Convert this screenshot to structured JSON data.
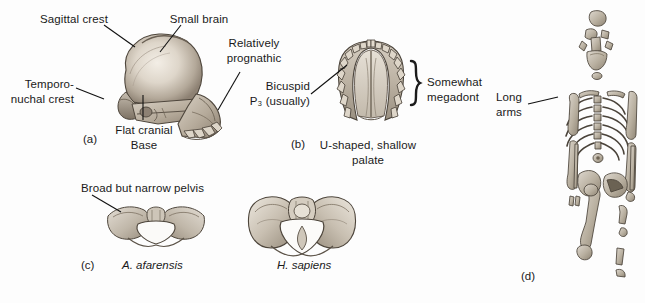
{
  "figure": {
    "background_color": "#fdfdfd",
    "ink_color": "#1a1a1a",
    "bone_fill": "#cfc8bf",
    "bone_shadow": "#8e857a",
    "bone_highlight": "#efe9e0"
  },
  "panels": {
    "a": {
      "caption": "(a)",
      "subject": "cranium-lateral-view",
      "labels": {
        "sagittal_crest": "Sagittal crest",
        "small_brain": "Small brain",
        "relatively_prognathic": "Relatively\nprognathic",
        "temporo_nuchal_crest": "Temporo-\nnuchal crest",
        "flat_cranial_base": "Flat cranial\nBase"
      }
    },
    "b": {
      "caption": "(b)",
      "subject": "maxillary-palate-occlusal-view",
      "labels": {
        "bicuspid": "Bicuspid\nP₃ (usually)",
        "somewhat_megadont": "Somewhat\nmegadont",
        "palate_shape": "U-shaped, shallow\npalate"
      }
    },
    "c": {
      "caption": "(c)",
      "subject": "pelvis-comparison",
      "labels": {
        "broad_but_narrow_pelvis": "Broad but narrow pelvis"
      },
      "specimens": [
        {
          "name": "A. afarensis",
          "italic": true
        },
        {
          "name": "H. sapiens",
          "italic": true
        }
      ]
    },
    "d": {
      "caption": "(d)",
      "subject": "partial-skeleton",
      "labels": {
        "long_arms": "Long\narms"
      }
    }
  }
}
